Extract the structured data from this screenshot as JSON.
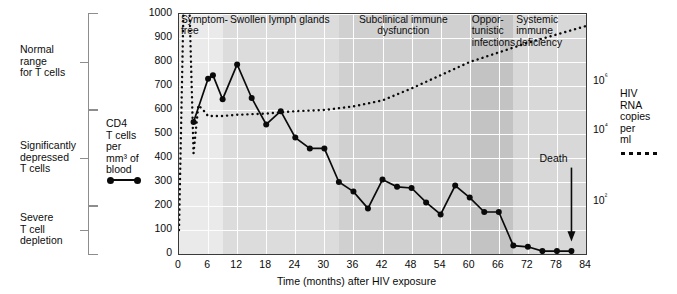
{
  "figure": {
    "xaxis_title": "Time (months) after HIV exposure",
    "left_axis_title": "CD4\nT cells\nper\nmm³ of\nblood",
    "right_axis_title": "HIV\nRNA\ncopies\nper\nml",
    "death_annotation": "Death"
  },
  "left_brackets": [
    {
      "label": "Normal\nrange\nfor T cells",
      "from": 1000,
      "to": 600
    },
    {
      "label": "Significantly\ndepressed\nT cells",
      "from": 600,
      "to": 200
    },
    {
      "label": "Severe\nT cell\ndepletion",
      "from": 200,
      "to": 0
    }
  ],
  "phases": [
    {
      "label": "Symptom-\nfree",
      "start": 0,
      "end": 9,
      "shade": "#eaeaea"
    },
    {
      "label": "Swollen lymph glands",
      "start": 9,
      "end": 33,
      "shade": "#dcdcdc"
    },
    {
      "label": "Subclinical immune\ndysfunction",
      "start": 33,
      "end": 60,
      "shade": "#d0d0d0"
    },
    {
      "label": "Oppor-\ntunistic\ninfections",
      "start": 60,
      "end": 69,
      "shade": "#c3c3c3"
    },
    {
      "label": "Systemic\nimmune\ndeficiency",
      "start": 69,
      "end": 84,
      "shade": "#d8d8d8"
    }
  ],
  "chart_data": {
    "type": "line",
    "title": "",
    "xlabel": "Time (months) after HIV exposure",
    "ylabel": "CD4 T cells per mm³ of blood",
    "y2label": "HIV RNA copies per ml",
    "xlim": [
      0,
      84
    ],
    "ylim": [
      0,
      1000
    ],
    "xticks": [
      0,
      6,
      12,
      18,
      24,
      30,
      36,
      42,
      48,
      54,
      60,
      66,
      72,
      78,
      84
    ],
    "yticks": [
      0,
      100,
      200,
      300,
      400,
      500,
      600,
      700,
      800,
      900,
      1000
    ],
    "y2ticks": [
      "10²",
      "10⁴",
      "10⁶"
    ],
    "y2tick_values": [
      100,
      10000,
      1000000
    ],
    "grid": true,
    "legend_position": "outside-left and outside-right",
    "series": [
      {
        "name": "CD4 T cells per mm³ of blood",
        "style": "solid-with-markers",
        "axis": "left",
        "color": "#0a0a0a",
        "x": [
          3,
          6,
          7,
          9,
          12,
          15,
          18,
          21,
          24,
          27,
          30,
          33,
          36,
          39,
          42,
          45,
          48,
          51,
          54,
          57,
          60,
          63,
          66,
          69,
          72,
          75,
          78,
          81
        ],
        "values": [
          550,
          730,
          745,
          645,
          790,
          650,
          540,
          595,
          485,
          440,
          440,
          300,
          260,
          190,
          310,
          280,
          275,
          215,
          165,
          285,
          235,
          175,
          175,
          35,
          30,
          12,
          12,
          12
        ]
      },
      {
        "name": "HIV RNA copies per ml",
        "style": "dotted",
        "axis": "right",
        "color": "#0a0a0a",
        "x": [
          0,
          1,
          2,
          3,
          4,
          5,
          6,
          9,
          12,
          18,
          24,
          30,
          36,
          42,
          48,
          54,
          60,
          66,
          72,
          78,
          84
        ],
        "values_left_scale": [
          100,
          1100,
          1150,
          420,
          620,
          600,
          575,
          575,
          580,
          585,
          595,
          600,
          615,
          640,
          690,
          745,
          800,
          840,
          880,
          915,
          950
        ],
        "note": "dotted curve: sharp acute spike in first weeks, drop to set-point, then slow sustained rise"
      }
    ],
    "annotations": [
      {
        "text": "Death",
        "x": 81,
        "type": "arrow-down"
      }
    ]
  }
}
